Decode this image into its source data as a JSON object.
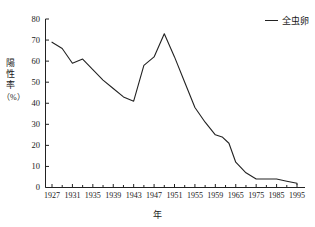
{
  "chart_data": {
    "type": "line",
    "title": "",
    "xlabel": "年",
    "ylabel": "陽性率（%）",
    "ylabel_chars": [
      "陽",
      "性",
      "率"
    ],
    "ylabel_unit": "（%）",
    "ylim": [
      0,
      80
    ],
    "ytick_values": [
      0,
      10,
      20,
      30,
      40,
      50,
      60,
      70,
      80
    ],
    "ytick_labels": [
      "0",
      "10",
      "20",
      "30",
      "40",
      "50",
      "60",
      "70",
      "80"
    ],
    "grid": false,
    "legend_position": "top-right",
    "legend": [
      "全虫卵"
    ],
    "xtick_labels": [
      "1927",
      "1931",
      "1935",
      "1939",
      "1943",
      "1947",
      "1951",
      "1955",
      "1959",
      "1965",
      "1975",
      "1985",
      "1995"
    ],
    "series": [
      {
        "name": "全虫卵",
        "color": "#222222",
        "x": [
          "1927",
          "1929",
          "1931",
          "1933",
          "1935",
          "1937",
          "1939",
          "1941",
          "1943",
          "1945",
          "1947",
          "1949",
          "1951",
          "1953",
          "1955",
          "1957",
          "1959",
          "1961",
          "1963",
          "1965",
          "1970",
          "1975",
          "1980",
          "1985",
          "1990",
          "1995",
          "1998"
        ],
        "values": [
          69,
          66,
          59,
          61,
          56,
          51,
          47,
          43,
          41,
          58,
          62,
          73,
          62,
          50,
          38,
          31,
          25,
          24,
          21,
          12,
          7,
          4,
          4,
          4,
          3,
          2,
          1.5
        ]
      }
    ]
  },
  "axes": {
    "y_axis_name": "positive-rate-axis",
    "x_axis_name": "year-axis"
  }
}
